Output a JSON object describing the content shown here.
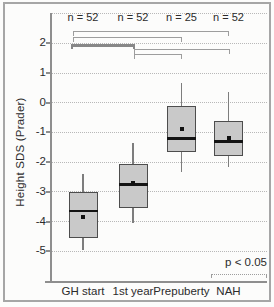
{
  "chart_data": {
    "type": "boxplot",
    "title": "",
    "xlabel": "",
    "ylabel": "Height SDS (Prader)",
    "categories": [
      "GH start",
      "1st year",
      "Prepuberty",
      "NAH"
    ],
    "n_labels": [
      "n = 52",
      "n = 52",
      "n = 25",
      "n = 52"
    ],
    "ytick_labels": [
      "2",
      "1",
      "0",
      "-1",
      "-2",
      "-3",
      "-4",
      "-5"
    ],
    "ytick_values": [
      2,
      1,
      0,
      -1,
      -2,
      -3,
      -4,
      -5
    ],
    "grid_values": [
      3,
      2,
      1,
      0,
      -1,
      -2,
      -3,
      -4,
      -5
    ],
    "ylim": [
      -6.1,
      3
    ],
    "grid": "horizontal-dotted",
    "legend_position": "bottom-right",
    "boxes": [
      {
        "category": "GH start",
        "n_label": "n = 52",
        "n": 52,
        "whisker_low": -4.95,
        "q1": -4.55,
        "median": -3.65,
        "mean": -3.85,
        "q3": -3.0,
        "whisker_high": -2.4
      },
      {
        "category": "1st year",
        "n_label": "n = 52",
        "n": 52,
        "whisker_low": -4.05,
        "q1": -3.55,
        "median": -2.75,
        "mean": -2.7,
        "q3": -2.05,
        "whisker_high": -1.35
      },
      {
        "category": "Prepuberty",
        "n_label": "n = 25",
        "n": 25,
        "whisker_low": -2.35,
        "q1": -1.65,
        "median": -1.2,
        "mean": -0.9,
        "q3": -0.1,
        "whisker_high": 0.65
      },
      {
        "category": "NAH",
        "n_label": "n = 52",
        "n": 52,
        "whisker_low": -2.15,
        "q1": -1.8,
        "median": -1.3,
        "mean": -1.18,
        "q3": -0.6,
        "whisker_high": 0.35
      }
    ],
    "significance_brackets": [
      {
        "pair": [
          "GH start",
          "NAH"
        ],
        "bold": false
      },
      {
        "pair": [
          "GH start",
          "Prepuberty"
        ],
        "bold": false
      },
      {
        "pair": [
          "GH start",
          "1st year"
        ],
        "bold": true
      },
      {
        "pair": [
          "1st year",
          "NAH"
        ],
        "bold": false
      },
      {
        "pair": [
          "1st year",
          "Prepuberty"
        ],
        "bold": false
      }
    ],
    "annotation": "p < 0.05"
  },
  "colors": {
    "box_fill": "#c9c9c9",
    "box_border": "#4d4d4d",
    "median": "#141414",
    "mean_marker": "#111111",
    "whisker": "#7d7d7d",
    "grid": "#b8b8b8",
    "axis": "#8e8e8e",
    "bracket": "#9d9d9d",
    "bracket_bold": "#878787",
    "frame": "#a6a6a6",
    "text": "#2b2b2b",
    "background": "#fcfcfb"
  }
}
